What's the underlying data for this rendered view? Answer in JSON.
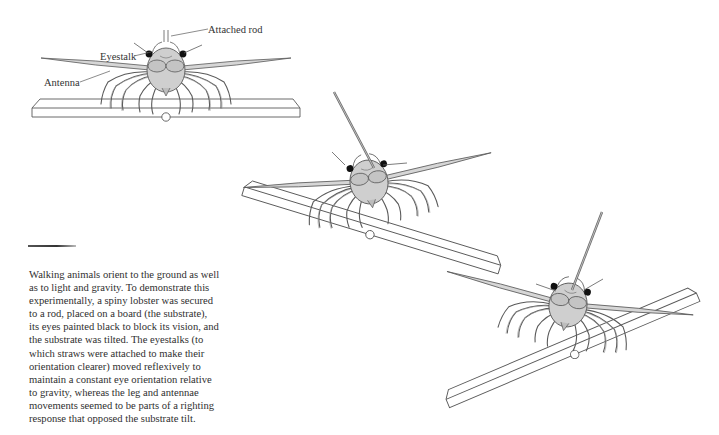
{
  "figure": {
    "labels": {
      "attached_rod": "Attached rod",
      "eyestalk": "Eyestalk",
      "antenna": "Antenna"
    },
    "panels": [
      {
        "name": "level-substrate",
        "substrate_tilt_deg": 0
      },
      {
        "name": "tilted-substrate-right-down",
        "substrate_tilt_deg": 17
      },
      {
        "name": "tilted-substrate-left-down",
        "substrate_tilt_deg": -23
      }
    ],
    "colors": {
      "line": "#5a5a5a",
      "body_fill": "#cfcfcf",
      "eye": "#111111",
      "board_fill": "#ffffff"
    }
  },
  "caption": {
    "lines": [
      "Walking animals orient to the ground as well",
      "as to light and gravity. To demonstrate this",
      "experimentally, a spiny lobster was secured",
      "to a rod, placed on a board (the substrate),",
      "its eyes painted black to block its vision, and",
      "the substrate was tilted. The eyestalks (to",
      "which straws were attached to make their",
      "orientation clearer) moved reflexively to",
      "maintain a constant eye orientation relative",
      "to gravity, whereas the leg and antennae",
      "movements seemed to be parts of a righting",
      "response that opposed the substrate tilt."
    ]
  }
}
